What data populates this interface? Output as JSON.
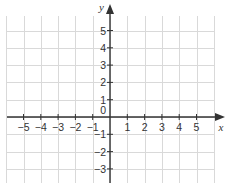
{
  "diagram": {
    "type": "coordinate-grid",
    "x_axis": {
      "name": "x",
      "tick_labels": [
        "−5",
        "−4",
        "−3",
        "−2",
        "−1",
        "1",
        "2",
        "3",
        "4",
        "5"
      ],
      "tick_values": [
        -5,
        -4,
        -3,
        -2,
        -1,
        1,
        2,
        3,
        4,
        5
      ]
    },
    "y_axis": {
      "name": "y",
      "tick_labels": [
        "5",
        "4",
        "3",
        "2",
        "1",
        "−1",
        "−2",
        "−3"
      ],
      "tick_values": [
        5,
        4,
        3,
        2,
        1,
        -1,
        -2,
        -3
      ]
    },
    "origin_label": "0",
    "colors": {
      "grid": "#d9d9d9",
      "axis": "#333333",
      "text": "#333333",
      "background": "#ffffff"
    }
  }
}
